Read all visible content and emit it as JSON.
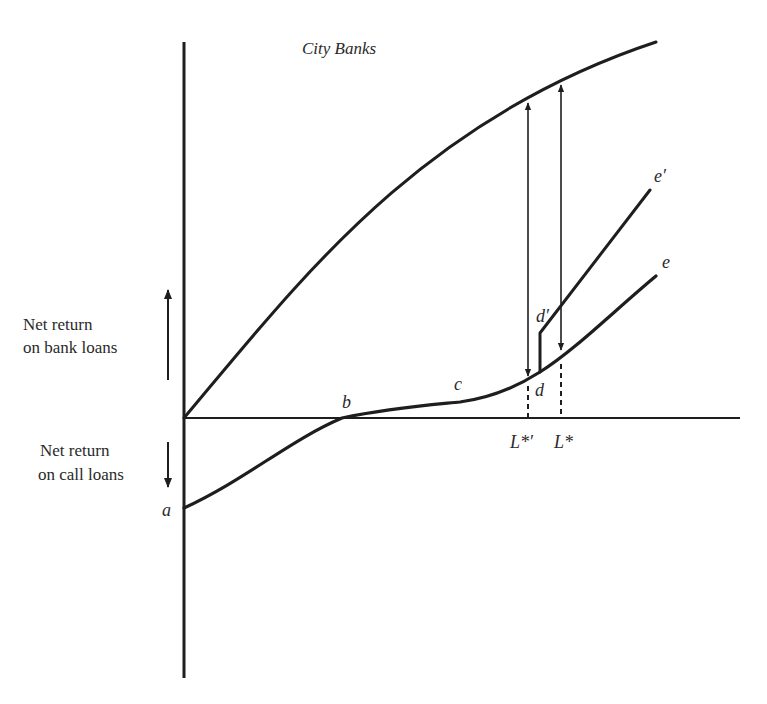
{
  "diagram": {
    "title": "City Banks",
    "y_axis_labels": {
      "positive": [
        "Net return",
        "on bank loans"
      ],
      "negative": [
        "Net return",
        "on call loans"
      ]
    },
    "point_labels": {
      "a": "a",
      "b": "b",
      "c": "c",
      "d": "d",
      "d_prime": "d′",
      "e": "e",
      "e_prime": "e′"
    },
    "x_axis_labels": {
      "L_star_prime": "L*′",
      "L_star": "L*"
    },
    "colors": {
      "ink": "#1e1e1e",
      "background": "#ffffff"
    }
  }
}
